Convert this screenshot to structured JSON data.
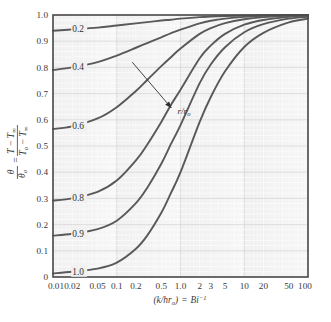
{
  "chart_data": {
    "type": "line",
    "title": "",
    "subtitle": "",
    "xlabel": "(k/hr₀) = Bi⁻¹",
    "ylabel": "θ/θ₀ = (T − T∞)/(T₀ − T∞)",
    "xscale": "log",
    "yscale": "linear",
    "xlim": [
      0.01,
      100
    ],
    "ylim": [
      0,
      1.0
    ],
    "grid": true,
    "legend_position": "inline-curve-labels",
    "xticks": [
      "0.01",
      "0.02",
      "0.05",
      "0.1",
      "0.2",
      "0.5",
      "1.0",
      "2",
      "3",
      "5",
      "10",
      "20",
      "50",
      "100"
    ],
    "xtick_values": [
      0.01,
      0.02,
      0.05,
      0.1,
      0.2,
      0.5,
      1.0,
      2,
      3,
      5,
      10,
      20,
      50,
      100
    ],
    "yticks": [
      "0",
      "0.1",
      "0.2",
      "0.3",
      "0.4",
      "0.5",
      "0.6",
      "0.7",
      "0.8",
      "0.9",
      "1.0"
    ],
    "ytick_values": [
      0,
      0.1,
      0.2,
      0.3,
      0.4,
      0.5,
      0.6,
      0.7,
      0.8,
      0.9,
      1.0
    ],
    "annotations": [
      {
        "text": "r/r₀",
        "x": 0.9,
        "y": 0.635,
        "arrow_from": [
          0.175,
          0.82
        ],
        "arrow_to": [
          0.72,
          0.645
        ]
      }
    ],
    "series": [
      {
        "name": "0.2",
        "label": "0.2",
        "x": [
          0.01,
          0.02,
          0.05,
          0.1,
          0.2,
          0.3,
          0.5,
          0.7,
          1.0,
          2,
          3,
          5,
          10,
          20,
          50,
          100
        ],
        "y": [
          0.94,
          0.945,
          0.952,
          0.96,
          0.968,
          0.973,
          0.979,
          0.982,
          0.986,
          0.992,
          0.994,
          0.996,
          0.998,
          0.999,
          1.0,
          1.0
        ]
      },
      {
        "name": "0.4",
        "label": "0.4",
        "x": [
          0.01,
          0.02,
          0.05,
          0.1,
          0.2,
          0.3,
          0.5,
          0.7,
          1.0,
          2,
          3,
          5,
          10,
          20,
          50,
          100
        ],
        "y": [
          0.79,
          0.8,
          0.82,
          0.845,
          0.875,
          0.893,
          0.915,
          0.93,
          0.944,
          0.968,
          0.978,
          0.986,
          0.993,
          0.997,
          0.999,
          1.0
        ]
      },
      {
        "name": "0.6",
        "label": "0.6",
        "x": [
          0.01,
          0.02,
          0.05,
          0.1,
          0.2,
          0.3,
          0.5,
          0.7,
          1.0,
          2,
          3,
          5,
          10,
          20,
          50,
          100
        ],
        "y": [
          0.565,
          0.575,
          0.605,
          0.648,
          0.71,
          0.752,
          0.805,
          0.838,
          0.872,
          0.928,
          0.95,
          0.969,
          0.984,
          0.992,
          0.997,
          0.999
        ]
      },
      {
        "name": "0.8",
        "label": "0.8",
        "x": [
          0.01,
          0.02,
          0.05,
          0.1,
          0.2,
          0.3,
          0.5,
          0.7,
          1.0,
          2,
          3,
          5,
          10,
          20,
          50,
          100
        ],
        "y": [
          0.292,
          0.3,
          0.325,
          0.368,
          0.445,
          0.505,
          0.592,
          0.655,
          0.715,
          0.835,
          0.884,
          0.928,
          0.963,
          0.981,
          0.993,
          0.996
        ]
      },
      {
        "name": "0.9",
        "label": "0.9",
        "x": [
          0.01,
          0.02,
          0.05,
          0.1,
          0.2,
          0.3,
          0.5,
          0.7,
          1.0,
          2,
          3,
          5,
          10,
          20,
          50,
          100
        ],
        "y": [
          0.158,
          0.165,
          0.183,
          0.215,
          0.282,
          0.34,
          0.432,
          0.505,
          0.58,
          0.74,
          0.812,
          0.877,
          0.934,
          0.965,
          0.986,
          0.993
        ]
      },
      {
        "name": "1.0",
        "label": "1.0",
        "x": [
          0.01,
          0.02,
          0.05,
          0.1,
          0.2,
          0.3,
          0.5,
          0.7,
          1.0,
          2,
          3,
          5,
          10,
          20,
          50,
          100
        ],
        "y": [
          0.014,
          0.02,
          0.032,
          0.055,
          0.108,
          0.158,
          0.245,
          0.318,
          0.4,
          0.592,
          0.688,
          0.785,
          0.878,
          0.932,
          0.972,
          0.986
        ]
      }
    ],
    "curve_labels": [
      {
        "text": "0.2",
        "x": 0.02,
        "y": 0.945
      },
      {
        "text": "0.4",
        "x": 0.02,
        "y": 0.8
      },
      {
        "text": "0.6",
        "x": 0.02,
        "y": 0.575
      },
      {
        "text": "0.8",
        "x": 0.02,
        "y": 0.3
      },
      {
        "text": "0.9",
        "x": 0.02,
        "y": 0.165
      },
      {
        "text": "1.0",
        "x": 0.02,
        "y": 0.02
      }
    ],
    "colors": {
      "curve": "#595959",
      "plot_background": "#f1f1f1",
      "gridline_minor": "#ffffff",
      "gridline_major": "#d8d8d8",
      "axis_frame": "#4a4a4a",
      "text": "#3a3a3a",
      "page_background": "#ffffff"
    }
  },
  "ylabel_parts": {
    "theta": "θ",
    "theta_sub": "o",
    "num_left": "T",
    "num_right": "T",
    "num_right_sub": "∞",
    "den_left": "T",
    "den_left_sub": "o",
    "den_right": "T",
    "den_right_sub": "∞",
    "minus": "−",
    "equals": "="
  },
  "xlabel_parts": {
    "open": "(",
    "k": "k",
    "slash": "/",
    "h": "h",
    "r": "r",
    "r_sub": "o",
    "close": ")",
    "equals": "=",
    "Bi": "Bi",
    "exp": "−1"
  },
  "annotation_label": {
    "r1": "r",
    "slash": "/",
    "r2": "r",
    "r2_sub": "o"
  }
}
